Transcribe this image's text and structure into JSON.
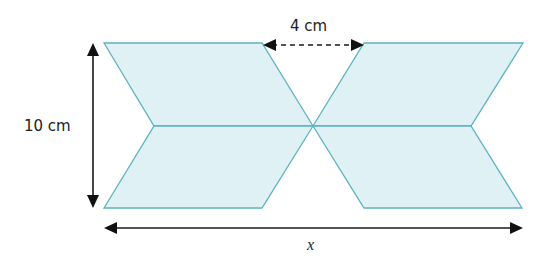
{
  "diagram": {
    "shapes": [
      {
        "name": "top-left-parallelogram"
      },
      {
        "name": "bottom-left-parallelogram"
      },
      {
        "name": "top-right-parallelogram"
      },
      {
        "name": "bottom-right-parallelogram"
      }
    ],
    "labels": {
      "height": "10 cm",
      "gap": "4 cm",
      "width": "x"
    },
    "colors": {
      "fill": "#dff1f5",
      "stroke": "#5eb3c2",
      "arrow": "#111111"
    }
  }
}
